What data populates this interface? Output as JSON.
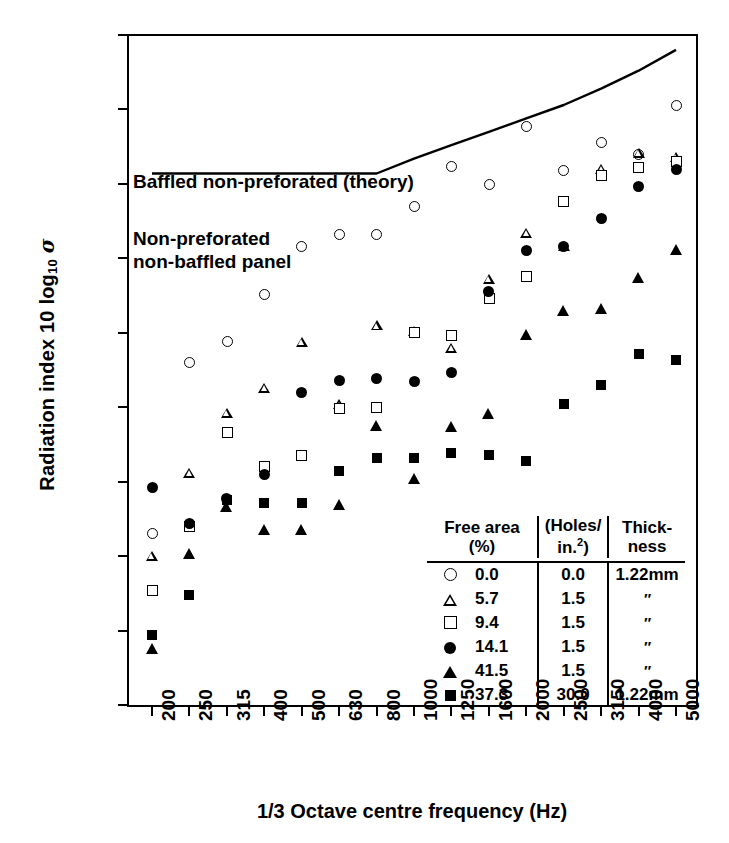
{
  "chart_data": {
    "type": "scatter",
    "title": "",
    "xlabel": "1/3 Octave centre frequency (Hz)",
    "ylabel": "Radiation index 10 log10 σ",
    "categories": [
      "200",
      "250",
      "315",
      "400",
      "500",
      "630",
      "800",
      "1000",
      "1250",
      "1600",
      "2000",
      "2500",
      "3150",
      "4000",
      "5000"
    ],
    "ylim": [
      -55,
      -10
    ],
    "yticks": [
      "-10",
      "-15",
      "-20",
      "-25",
      "-30",
      "-35",
      "-40",
      "-45",
      "-50",
      "-55"
    ],
    "grid": false,
    "legend_position": "inside-bottom-right",
    "series": [
      {
        "name": "0.0",
        "marker": "open-circle",
        "values": [
          -43.5,
          -32.0,
          -30.6,
          -27.4,
          -24.2,
          -23.4,
          -23.4,
          -21.5,
          -18.8,
          -20.0,
          -16.1,
          -19.1,
          -17.2,
          -18.0,
          -14.7
        ]
      },
      {
        "name": "5.7",
        "marker": "open-triangle",
        "values": [
          -45.0,
          -39.4,
          -35.4,
          -33.7,
          -30.6,
          -34.8,
          -29.5,
          -29.9,
          -31.0,
          -26.4,
          -23.3,
          -24.2,
          -19.0,
          -17.9,
          -18.2
        ]
      },
      {
        "name": "9.4",
        "marker": "open-square",
        "values": [
          -47.3,
          -43.0,
          -36.7,
          -39.0,
          -38.2,
          -35.1,
          -35.0,
          -30.0,
          -30.2,
          -27.7,
          -26.2,
          -21.2,
          -19.4,
          -18.9,
          -18.5
        ]
      },
      {
        "name": "14.1",
        "marker": "filled-circle",
        "values": [
          -40.4,
          -42.8,
          -41.1,
          -39.5,
          -34.0,
          -33.2,
          -33.1,
          -33.3,
          -32.7,
          -27.2,
          -24.5,
          -24.2,
          -22.3,
          -20.2,
          -19.0
        ]
      },
      {
        "name": "41.5",
        "marker": "filled-triangle",
        "values": [
          -51.2,
          -44.8,
          -41.7,
          -43.2,
          -43.2,
          -41.5,
          -36.2,
          -39.8,
          -36.3,
          -35.4,
          -30.1,
          -28.5,
          -28.4,
          -26.3,
          -24.4
        ]
      },
      {
        "name": "37.3",
        "marker": "filled-square",
        "values": [
          -50.3,
          -47.6,
          -41.2,
          -41.4,
          -41.4,
          -39.3,
          -38.4,
          -38.4,
          -38.1,
          -38.2,
          -38.6,
          -34.8,
          -33.5,
          -31.4,
          -31.8
        ]
      }
    ],
    "theory_curve": {
      "name": "Baffled non-preforated (theory)",
      "x": [
        "200",
        "250",
        "315",
        "400",
        "500",
        "630",
        "800",
        "1000",
        "1250",
        "1600",
        "2000",
        "2500",
        "3150",
        "4000",
        "5000"
      ],
      "y": [
        -19.3,
        -19.3,
        -19.3,
        -19.3,
        -19.3,
        -19.3,
        -19.3,
        -18.3,
        -17.4,
        -16.5,
        -15.6,
        -14.7,
        -13.6,
        -12.4,
        -11.0
      ]
    },
    "annotations": [
      {
        "text": "Baffled non-preforated (theory)",
        "x": "200",
        "y": -20.3
      },
      {
        "text": "Non-preforated",
        "x": "200",
        "y": -24.3
      },
      {
        "text": "non-baffled panel",
        "x": "200",
        "y": -25.9
      }
    ]
  },
  "axis": {
    "y_label_main": "Radiation index 10 log",
    "y_label_sub": "10",
    "y_label_sigma": "σ",
    "x_label": "1/3 Octave centre frequency (Hz)",
    "y_ticks": [
      "-10",
      "-15",
      "-20",
      "-25",
      "-30",
      "-35",
      "-40",
      "-45",
      "-50",
      "-55"
    ],
    "x_ticks": [
      "200",
      "250",
      "315",
      "400",
      "500",
      "630",
      "800",
      "1000",
      "1250",
      "1600",
      "2000",
      "2500",
      "3150",
      "4000",
      "5000"
    ]
  },
  "annotations": {
    "theory_label": "Baffled non-preforated (theory)",
    "panel_label_line1": "Non-preforated",
    "panel_label_line2": "non-baffled panel"
  },
  "legend": {
    "headers": {
      "col1_line1": "Free area",
      "col1_line2": "(%)",
      "col2_line1": "(Holes/",
      "col2_line2_pre": "in.",
      "col2_line2_sup": "2",
      "col2_line2_post": ")",
      "col3_line1": "Thick-",
      "col3_line2": "ness"
    },
    "rows": [
      {
        "marker": "open-circle",
        "free_area": "0.0",
        "holes": "0.0",
        "thickness": "1.22mm"
      },
      {
        "marker": "open-triangle",
        "free_area": "5.7",
        "holes": "1.5",
        "thickness": "″"
      },
      {
        "marker": "open-square",
        "free_area": "9.4",
        "holes": "1.5",
        "thickness": "″"
      },
      {
        "marker": "filled-circle",
        "free_area": "14.1",
        "holes": "1.5",
        "thickness": "″"
      },
      {
        "marker": "filled-triangle",
        "free_area": "41.5",
        "holes": "1.5",
        "thickness": "″"
      },
      {
        "marker": "filled-square",
        "free_area": "37.3",
        "holes": "30.0",
        "thickness": "1.22mm"
      }
    ]
  },
  "colors": {
    "ink": "#000000",
    "paper": "#ffffff"
  }
}
